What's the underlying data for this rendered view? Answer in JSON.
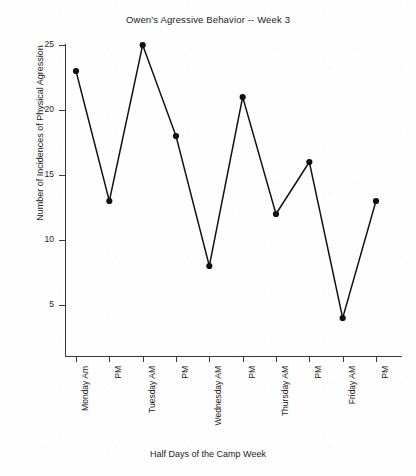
{
  "chart_data": {
    "type": "line",
    "title": "Owen's Agressive Behavior -- Week 3",
    "xlabel": "Half Days of the Camp Week",
    "ylabel": "Number of Incidences of Physical Agression",
    "categories": [
      "Monday Am",
      "PM",
      "Tuesday AM",
      "PM",
      "Wednesday AM",
      "PM",
      "Thursday AM",
      "PM",
      "Friday AM",
      "PM"
    ],
    "values": [
      23,
      13,
      25,
      18,
      8,
      21,
      12,
      16,
      4,
      13
    ],
    "ylim": [
      0,
      25
    ],
    "ytick_labels": [
      "25",
      "20",
      "15",
      "10",
      "5"
    ],
    "ytick_values": [
      25,
      20,
      15,
      10,
      5
    ],
    "grid": false,
    "legend": "none",
    "marker": "filled-circle",
    "line_color": "#101010",
    "marker_color": "#101010",
    "axis_color": "#3a3a3a",
    "background": "#fefefe"
  }
}
